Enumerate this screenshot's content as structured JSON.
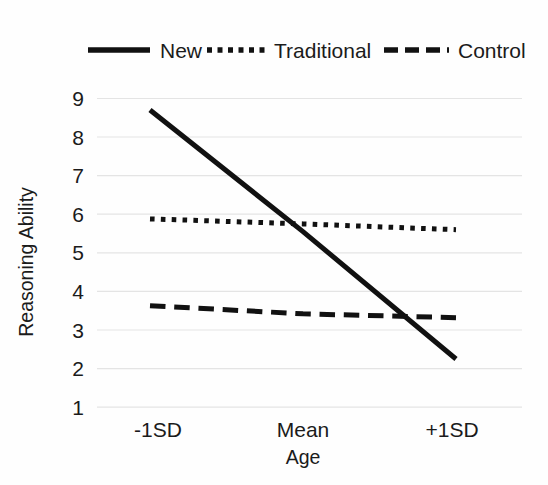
{
  "chart_data": {
    "type": "line",
    "title": "",
    "xlabel": "Age",
    "ylabel": "Reasoning Ability",
    "categories": [
      "-1SD",
      "Mean",
      "+1SD"
    ],
    "ylim": [
      1,
      9
    ],
    "yticks": [
      1,
      2,
      3,
      4,
      5,
      6,
      7,
      8,
      9
    ],
    "ytick_labels": [
      "1",
      "2",
      "3",
      "4",
      "5",
      "6",
      "7",
      "8",
      "9"
    ],
    "grid": "horizontal",
    "legend_position": "top",
    "series": [
      {
        "name": "New",
        "style": "solid",
        "color": "#111111",
        "width": 5,
        "values": [
          8.7,
          5.55,
          2.25
        ]
      },
      {
        "name": "Traditional",
        "style": "dotted",
        "color": "#111111",
        "width": 5,
        "values": [
          5.88,
          5.75,
          5.6
        ]
      },
      {
        "name": "Control",
        "style": "dashed",
        "color": "#111111",
        "width": 5,
        "values": [
          3.63,
          3.42,
          3.32
        ]
      }
    ]
  },
  "legend": {
    "items": [
      {
        "label": "New",
        "style": "solid"
      },
      {
        "label": "Traditional",
        "style": "dotted"
      },
      {
        "label": "Control",
        "style": "dashed"
      }
    ]
  },
  "axes": {
    "x_title": "Age",
    "y_title": "Reasoning Ability",
    "x_tick_labels": [
      "-1SD",
      "Mean",
      "+1SD"
    ],
    "y_tick_labels": [
      "9",
      "8",
      "7",
      "6",
      "5",
      "4",
      "3",
      "2",
      "1"
    ]
  }
}
